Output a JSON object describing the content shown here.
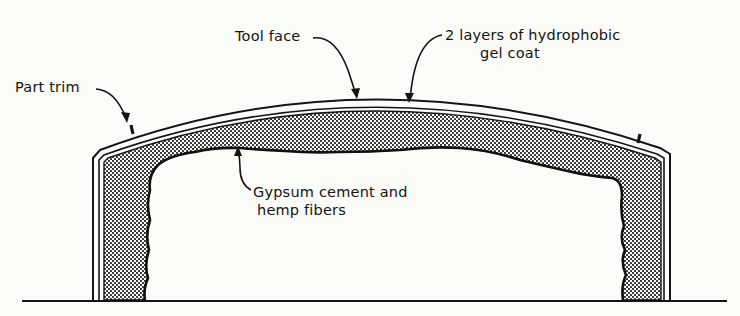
{
  "diagram": {
    "labels": {
      "tool_face": "Tool face",
      "gel_coat_line1": "2 layers of hydrophobic",
      "gel_coat_line2": "gel coat",
      "part_trim": "Part trim",
      "gypsum_line1": "Gypsum cement and",
      "gypsum_line2": "hemp fibers"
    },
    "colors": {
      "ink": "#141414",
      "paper": "#fbfbf8",
      "stipple": "#2a2a2a"
    }
  }
}
